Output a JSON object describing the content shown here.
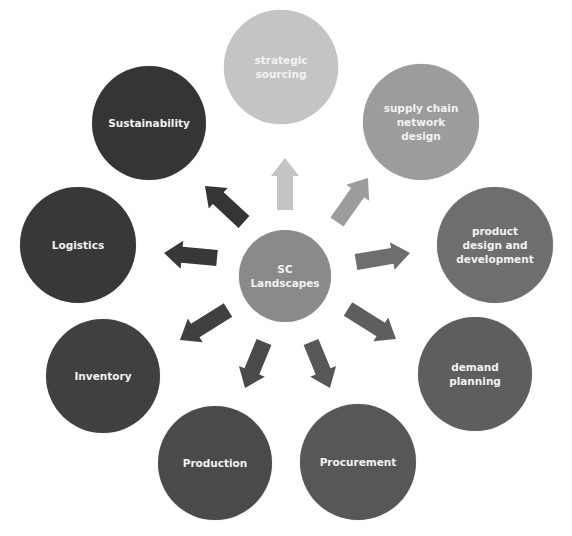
{
  "diagram": {
    "type": "hub-and-spoke",
    "center": {
      "label": "SC\nLandscapes",
      "color": "#8a8a8a",
      "cx": 285,
      "cy": 276,
      "r": 46
    },
    "nodes": [
      {
        "id": "strategic-sourcing",
        "label": "strategic\nsourcing",
        "color": "#c4c4c4",
        "cx": 281,
        "cy": 67,
        "r": 57
      },
      {
        "id": "supply-chain-network-design",
        "label": "supply chain\nnetwork\ndesign",
        "color": "#9c9c9c",
        "cx": 421,
        "cy": 122,
        "r": 58
      },
      {
        "id": "product-design-and-development",
        "label": "product\ndesign and\ndevelopment",
        "color": "#6e6e6e",
        "cx": 495,
        "cy": 245,
        "r": 58
      },
      {
        "id": "demand-planning",
        "label": "demand\nplanning",
        "color": "#5e5e5e",
        "cx": 475,
        "cy": 374,
        "r": 57
      },
      {
        "id": "procurement",
        "label": "Procurement",
        "color": "#575757",
        "cx": 358,
        "cy": 462,
        "r": 58
      },
      {
        "id": "production",
        "label": "Production",
        "color": "#4a4a4a",
        "cx": 215,
        "cy": 463,
        "r": 57
      },
      {
        "id": "inventory",
        "label": "Inventory",
        "color": "#404040",
        "cx": 103,
        "cy": 376,
        "r": 57
      },
      {
        "id": "logistics",
        "label": "Logistics",
        "color": "#383838",
        "cx": 78,
        "cy": 245,
        "r": 58
      },
      {
        "id": "sustainability",
        "label": "Sustainability",
        "color": "#353535",
        "cx": 149,
        "cy": 123,
        "r": 57
      }
    ],
    "arrows": [
      {
        "to": "strategic-sourcing",
        "color": "#c4c4c4",
        "x1": 285,
        "y1": 210,
        "x2": 285,
        "y2": 158
      },
      {
        "to": "supply-chain-network-design",
        "color": "#9c9c9c",
        "x1": 337,
        "y1": 222,
        "x2": 368,
        "y2": 178
      },
      {
        "to": "product-design-and-development",
        "color": "#6e6e6e",
        "x1": 356,
        "y1": 262,
        "x2": 410,
        "y2": 253
      },
      {
        "to": "demand-planning",
        "color": "#5e5e5e",
        "x1": 348,
        "y1": 309,
        "x2": 396,
        "y2": 339
      },
      {
        "to": "procurement",
        "color": "#575757",
        "x1": 311,
        "y1": 342,
        "x2": 330,
        "y2": 388
      },
      {
        "to": "production",
        "color": "#4a4a4a",
        "x1": 264,
        "y1": 342,
        "x2": 245,
        "y2": 388
      },
      {
        "to": "inventory",
        "color": "#404040",
        "x1": 228,
        "y1": 310,
        "x2": 180,
        "y2": 340
      },
      {
        "to": "logistics",
        "color": "#383838",
        "x1": 217,
        "y1": 258,
        "x2": 164,
        "y2": 253
      },
      {
        "to": "sustainability",
        "color": "#353535",
        "x1": 244,
        "y1": 222,
        "x2": 205,
        "y2": 186
      }
    ]
  }
}
